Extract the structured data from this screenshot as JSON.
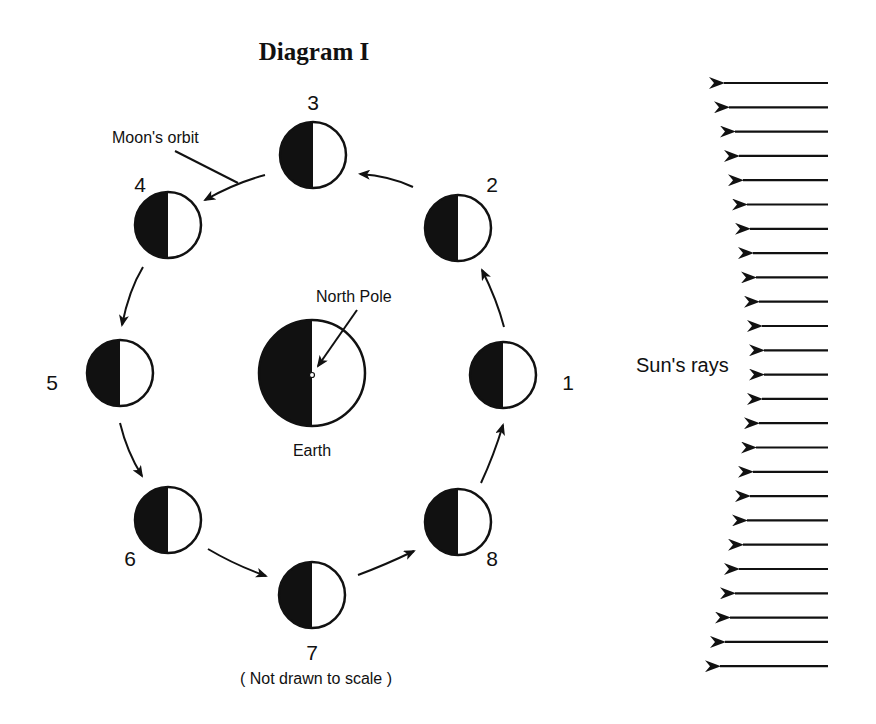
{
  "title": "Diagram I",
  "labels": {
    "moons_orbit": "Moon's orbit",
    "north_pole": "North  Pole",
    "earth": "Earth",
    "suns_rays": "Sun's rays",
    "scale_note": "( Not drawn to scale )"
  },
  "colors": {
    "ink": "#111111",
    "background": "#ffffff"
  },
  "earth": {
    "cx": 312,
    "cy": 373,
    "r": 53,
    "dark_side": "left"
  },
  "moons": [
    {
      "num": "1",
      "cx": 503,
      "cy": 375,
      "lx": 568,
      "ly": 390
    },
    {
      "num": "2",
      "cx": 458,
      "cy": 228,
      "lx": 492,
      "ly": 192
    },
    {
      "num": "3",
      "cx": 313,
      "cy": 155,
      "lx": 313,
      "ly": 110
    },
    {
      "num": "4",
      "cx": 168,
      "cy": 225,
      "lx": 140,
      "ly": 192
    },
    {
      "num": "5",
      "cx": 120,
      "cy": 373,
      "lx": 52,
      "ly": 390
    },
    {
      "num": "6",
      "cx": 168,
      "cy": 520,
      "lx": 130,
      "ly": 566
    },
    {
      "num": "7",
      "cx": 312,
      "cy": 595,
      "lx": 312,
      "ly": 660
    },
    {
      "num": "8",
      "cx": 458,
      "cy": 522,
      "lx": 492,
      "ly": 566
    }
  ],
  "moon_radius": 33,
  "sun_rays": {
    "count": 25,
    "start_y": 83,
    "spacing": 24.3,
    "right_x": 828,
    "tips_x": [
      722,
      727,
      733,
      737,
      741,
      745,
      748,
      751,
      754,
      757,
      760,
      762,
      762,
      760,
      757,
      754,
      751,
      748,
      745,
      741,
      737,
      733,
      728,
      723,
      718
    ]
  }
}
